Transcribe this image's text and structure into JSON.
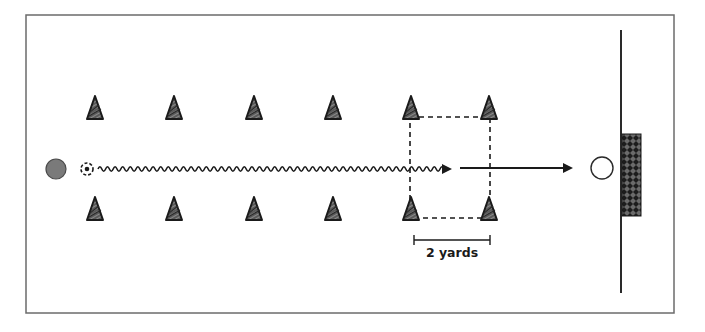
{
  "diagram": {
    "colors": {
      "frame": "#6b6b6b",
      "ink": "#1a1a1a",
      "player_fill": "#7a7a7a",
      "cone_fill": "#555555",
      "goal_fill": "#2a2a2a"
    },
    "elements": {
      "player": {
        "label": "player",
        "shape": "filled-circle"
      },
      "ball": {
        "label": "ball",
        "shape": "dashed-circle"
      },
      "dribble_path": {
        "label": "dribble path",
        "style": "wavy-arrow"
      },
      "pass_shot": {
        "label": "shot/pass",
        "style": "straight-arrow"
      },
      "target_player": {
        "label": "open circle (goalkeeper/target)",
        "shape": "open-circle"
      },
      "goal": {
        "label": "goal",
        "style": "cross-hatched"
      },
      "end_line": {
        "label": "goal line"
      },
      "gate_box": {
        "label": "2-yard gate",
        "style": "dashed-rectangle"
      }
    },
    "cones": {
      "top_row_count": 6,
      "bottom_row_count": 6
    },
    "measure": {
      "label": "2 yards"
    }
  }
}
